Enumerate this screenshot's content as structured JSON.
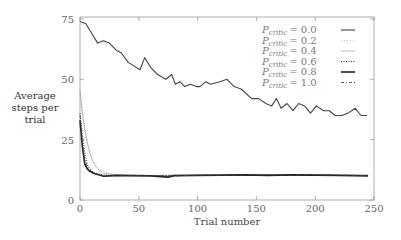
{
  "chart_data": {
    "type": "line",
    "title": "",
    "xlabel": "Trial number",
    "ylabel_lines": [
      "Average",
      "steps per",
      "trial"
    ],
    "xlim": [
      0,
      250
    ],
    "ylim": [
      0,
      75
    ],
    "xticks": [
      0,
      50,
      100,
      150,
      200,
      250
    ],
    "yticks": [
      0,
      25,
      50,
      75
    ],
    "grid": false,
    "legend_position": "top-right",
    "series": [
      {
        "name": "P_critic = 0.0",
        "label_base": "P",
        "label_sub": "critic",
        "label_value": "= 0.0",
        "style": "solid",
        "color": "#444444",
        "x": [
          0,
          5,
          15,
          20,
          25,
          31,
          35,
          41,
          51,
          55,
          60,
          66,
          73,
          78,
          81,
          85,
          89,
          94,
          99,
          102,
          107,
          111,
          119,
          125,
          131,
          137,
          146,
          152,
          158,
          163,
          167,
          171,
          176,
          181,
          186,
          191,
          196,
          201,
          207,
          212,
          217,
          223,
          228,
          234,
          239,
          244
        ],
        "y": [
          74,
          73,
          65,
          66,
          65,
          62,
          61,
          57,
          54,
          59,
          55,
          52,
          50,
          52,
          48,
          49,
          47,
          48,
          47,
          47,
          49,
          48,
          49,
          50,
          47,
          46,
          42,
          42,
          40,
          39,
          42,
          38,
          40,
          37,
          40,
          39,
          36,
          39,
          37,
          37,
          35,
          35,
          36,
          38,
          35,
          35
        ]
      },
      {
        "name": "P_critic = 0.2",
        "label_base": "P",
        "label_sub": "critic",
        "label_value": "= 0.2",
        "style": "dotted-light",
        "color": "#bbbbbb",
        "x": [
          0,
          2,
          4,
          6,
          8,
          10,
          12,
          15,
          18,
          22,
          26,
          30,
          40,
          60,
          80,
          100,
          120,
          140,
          160,
          180,
          200,
          220,
          245
        ],
        "y": [
          46,
          38,
          31,
          25,
          21,
          18,
          16,
          14,
          12.5,
          11.5,
          11,
          10.5,
          10.3,
          10.2,
          10.3,
          10.1,
          10.4,
          10.2,
          10.3,
          10.4,
          10.2,
          10.3,
          10.2
        ]
      },
      {
        "name": "P_critic = 0.4",
        "label_base": "P",
        "label_sub": "critic",
        "label_value": "= 0.4",
        "style": "thin-solid",
        "color": "#888888",
        "x": [
          0,
          2,
          4,
          6,
          8,
          10,
          12,
          14,
          17,
          20,
          24,
          30,
          40,
          60,
          80,
          100,
          120,
          140,
          160,
          180,
          200,
          220,
          245
        ],
        "y": [
          45,
          36,
          29,
          24,
          20,
          17,
          15,
          13.5,
          12.2,
          11.3,
          10.8,
          10.5,
          10.3,
          10.1,
          10.3,
          10.2,
          10.4,
          10.2,
          10.5,
          10.3,
          10.4,
          10.2,
          10.3
        ]
      },
      {
        "name": "P_critic = 0.6",
        "label_base": "P",
        "label_sub": "critic",
        "label_value": "= 0.6",
        "style": "dotted",
        "color": "#333333",
        "x": [
          0,
          2,
          4,
          6,
          8,
          10,
          12,
          15,
          18,
          22,
          26,
          30,
          40,
          60,
          80,
          100,
          120,
          140,
          160,
          180,
          200,
          220,
          245
        ],
        "y": [
          36,
          27,
          20,
          15,
          13,
          12,
          11.3,
          10.8,
          10.5,
          10.3,
          10.2,
          10.1,
          10.2,
          10.1,
          10.0,
          10.3,
          10.2,
          10.4,
          10.3,
          10.5,
          10.3,
          10.2,
          10.1
        ]
      },
      {
        "name": "P_critic = 0.8",
        "label_base": "P",
        "label_sub": "critic",
        "label_value": "= 0.8",
        "style": "thick-solid",
        "color": "#222222",
        "x": [
          0,
          2,
          4,
          6,
          8,
          10,
          12,
          15,
          18,
          20,
          25,
          30,
          40,
          60,
          75,
          80,
          100,
          120,
          140,
          160,
          180,
          200,
          220,
          245
        ],
        "y": [
          33,
          22,
          15,
          13,
          12,
          11.5,
          11,
          10.6,
          10.2,
          9.8,
          10,
          10.2,
          10.1,
          10,
          9.5,
          10.1,
          10.2,
          10.3,
          10.4,
          10.2,
          10.4,
          10.3,
          10.2,
          10.0
        ]
      },
      {
        "name": "P_critic = 1.0",
        "label_base": "P",
        "label_sub": "critic",
        "label_value": "= 1.0",
        "style": "dash-dot",
        "color": "#444444",
        "x": [
          0,
          2,
          4,
          6,
          8,
          10,
          12,
          15,
          18,
          22,
          26,
          30,
          40,
          60,
          80,
          100,
          120,
          140,
          160,
          180,
          200,
          220,
          245
        ],
        "y": [
          35,
          24,
          17,
          14,
          12.5,
          11.8,
          11.2,
          10.7,
          10.4,
          10.2,
          10.1,
          10.0,
          10.1,
          10.2,
          10.0,
          10.3,
          10.2,
          10.3,
          10.5,
          10.2,
          10.4,
          10.3,
          10.1
        ]
      }
    ]
  }
}
